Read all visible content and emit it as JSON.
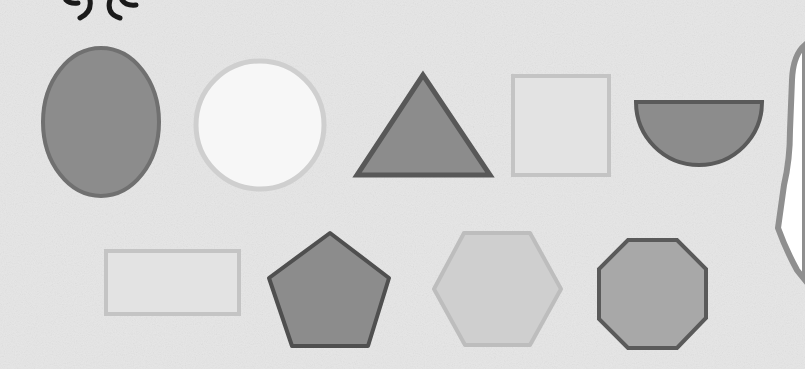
{
  "title": "Shapes worksheet",
  "colors": {
    "background": "#e6e6e6",
    "dark_fill": "#8c8c8c",
    "dark_stroke": "#5a5a5a",
    "light_fill": "#e3e3e3",
    "light_stroke": "#c4c4c4",
    "white_fill": "#f7f7f7",
    "hex_fill": "#cfcfcf",
    "hex_stroke": "#bdbdbd",
    "oct_fill": "#a8a8a8",
    "ink": "#1a1a1a",
    "edge": "#9a9a9a"
  },
  "shapes": [
    {
      "name": "oval",
      "label": "Oval"
    },
    {
      "name": "circle",
      "label": "Circle"
    },
    {
      "name": "triangle",
      "label": "Triangle"
    },
    {
      "name": "square",
      "label": "Square"
    },
    {
      "name": "semicircle",
      "label": "Semicircle"
    },
    {
      "name": "rectangle",
      "label": "Rectangle"
    },
    {
      "name": "pentagon",
      "label": "Pentagon"
    },
    {
      "name": "hexagon",
      "label": "Hexagon"
    },
    {
      "name": "octagon",
      "label": "Octagon"
    }
  ]
}
